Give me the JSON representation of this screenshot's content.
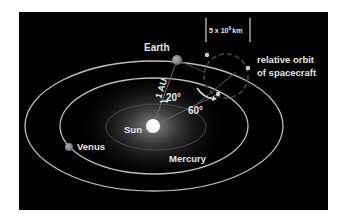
{
  "colors": {
    "background": "#ffffff",
    "panel": "#000000",
    "orbit_line": "#bdbdbd",
    "inner_orbit_line": "#4a4a4a",
    "label": "#e6e6e6",
    "planet": "#8a8a8a",
    "sun": "#ffffff",
    "relative_orbit": "#3a3a3a",
    "spacecraft_dot": "#cfcfcf"
  },
  "bodies": {
    "sun": {
      "label": "Sun"
    },
    "earth": {
      "label": "Earth"
    },
    "venus": {
      "label": "Venus"
    },
    "mercury": {
      "label": "Mercury"
    }
  },
  "annotations": {
    "distance": "1 AU",
    "angle_earth": "20°",
    "angle_spacecraft": "60°",
    "scale_base": "5 x 10",
    "scale_exp": "6",
    "scale_unit": "km",
    "relative_orbit_line1": "relative orbit",
    "relative_orbit_line2": "of spacecraft"
  }
}
